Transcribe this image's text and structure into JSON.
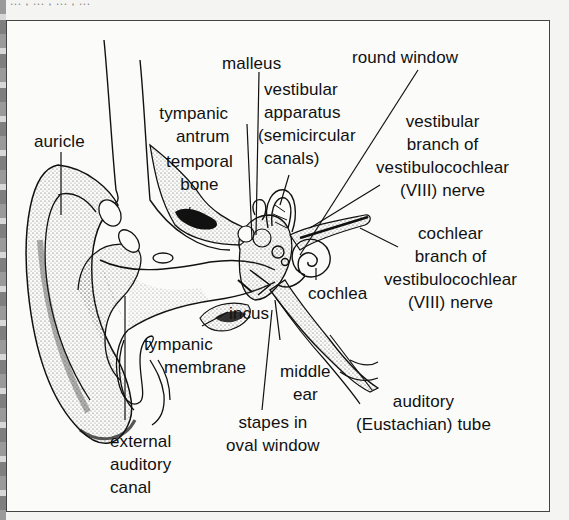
{
  "figure": {
    "top_cutoff_text": "...  ,  ...  ,  ...  ,  ...",
    "labels": {
      "auricle": [
        "auricle"
      ],
      "malleus": [
        "malleus"
      ],
      "tympanic_antrum": [
        "tympanic",
        "antrum"
      ],
      "temporal_bone": [
        "temporal",
        "bone"
      ],
      "vestibular_apparatus": [
        "vestibular",
        "apparatus",
        "(semicircular",
        "canals)"
      ],
      "round_window": [
        "round window"
      ],
      "vestibular_branch": [
        "vestibular",
        "branch of",
        "vestibulocochlear",
        "(VIII) nerve"
      ],
      "cochlear_branch": [
        "cochlear",
        "branch of",
        "vestibulocochlear",
        "(VIII) nerve"
      ],
      "cochlea": [
        "cochlea"
      ],
      "incus": [
        "incus"
      ],
      "tympanic_membrane": [
        "tympanic",
        "membrane"
      ],
      "middle_ear": [
        "middle",
        "ear"
      ],
      "auditory_tube": [
        "auditory",
        "(Eustachian) tube"
      ],
      "stapes": [
        "stapes in",
        "oval window"
      ],
      "external_canal": [
        "external",
        "auditory",
        "canal"
      ]
    },
    "colors": {
      "ink": "#111111",
      "paper": "#fbfbfa",
      "stipple": "#555555",
      "frame": "#444444"
    }
  }
}
